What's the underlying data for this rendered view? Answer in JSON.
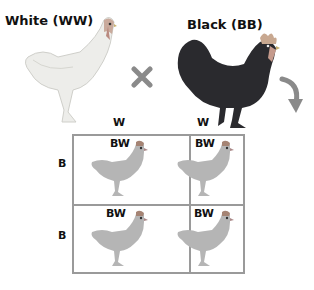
{
  "parents": {
    "female": {
      "label": "White (WW)",
      "color": "#eeeeea"
    },
    "male": {
      "label": "Black (BB)",
      "color": "#2a2a2e"
    }
  },
  "cross_symbol": {
    "icon": "cross-x-icon",
    "color": "#8a8a8a"
  },
  "arrow": {
    "icon": "curved-arrow-down-icon",
    "color": "#8a8a8a"
  },
  "punnett": {
    "column_alleles": [
      "W",
      "W"
    ],
    "row_alleles": [
      "B",
      "B"
    ],
    "cells": [
      [
        "BW",
        "BW"
      ],
      [
        "BW",
        "BW"
      ]
    ],
    "offspring_color": "#b5b5b5",
    "border_color": "#9a9a9a"
  }
}
